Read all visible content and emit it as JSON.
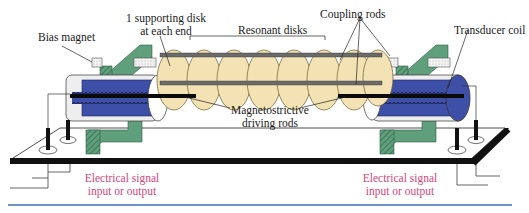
{
  "diagram": {
    "labels": {
      "bias_magnet": "Bias magnet",
      "supporting_disk_line1": "1 supporting disk",
      "supporting_disk_line2": "at each end",
      "resonant_disks": "Resonant disks",
      "coupling_rods": "Coupling rods",
      "transducer_coil": "Transducer coil",
      "driving_rods_line1": "Magnetostrictive",
      "driving_rods_line2": "driving rods",
      "signal_left_line1": "Electrical signal",
      "signal_left_line2": "input or output",
      "signal_right_line1": "Electrical signal",
      "signal_right_line2": "input or output"
    },
    "components": {
      "resonant_disk_count": 8,
      "supporting_disk_count": 2
    },
    "colors": {
      "disk_fill": "#f3e3b4",
      "magnet_green": "#5f9f7c",
      "coil_blue": "#3e4fa8",
      "base_plate": "#111111",
      "signal_text": "#d6457a",
      "rule_blue": "#3b6fb6"
    }
  }
}
